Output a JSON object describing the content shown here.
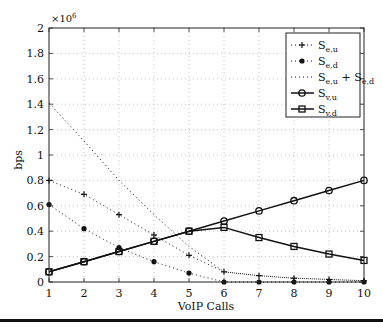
{
  "chart_data": {
    "type": "line",
    "title": "",
    "xlabel": "VoIP Calls",
    "ylabel": "bps",
    "y_multiplier": "×10^6",
    "xlim": [
      1,
      10
    ],
    "ylim": [
      0,
      2
    ],
    "grid": true,
    "legend_position": "upper right",
    "x": [
      1,
      2,
      3,
      4,
      5,
      6,
      7,
      8,
      9,
      10
    ],
    "x_ticks": [
      "1",
      "2",
      "3",
      "4",
      "5",
      "6",
      "7",
      "8",
      "9",
      "10"
    ],
    "y_ticks": [
      "0",
      "0.2",
      "0.4",
      "0.6",
      "0.8",
      "1",
      "1.2",
      "1.4",
      "1.6",
      "1.8",
      "2"
    ],
    "series": [
      {
        "name": "S_e,u",
        "label_main": "S",
        "label_sub": "e,u",
        "style": "dotted",
        "marker": "plus",
        "values": [
          0.8,
          0.69,
          0.53,
          0.37,
          0.21,
          0.08,
          0.05,
          0.03,
          0.02,
          0.01
        ]
      },
      {
        "name": "S_e,d",
        "label_main": "S",
        "label_sub": "e,d",
        "style": "dotted",
        "marker": "dot",
        "values": [
          0.61,
          0.42,
          0.27,
          0.16,
          0.07,
          0.0,
          0.0,
          0.0,
          0.0,
          0.0
        ]
      },
      {
        "name": "S_e,u + S_e,d",
        "label_main": "S",
        "label_sub": "e,u",
        "label_plus": " + S",
        "label_sub2": "e,d",
        "style": "dotted",
        "marker": "none",
        "values": [
          1.41,
          1.11,
          0.8,
          0.53,
          0.28,
          0.08,
          0.05,
          0.03,
          0.02,
          0.01
        ]
      },
      {
        "name": "S_v,u",
        "label_main": "S",
        "label_sub": "v,u",
        "style": "solid",
        "marker": "circle",
        "values": [
          0.08,
          0.16,
          0.24,
          0.32,
          0.4,
          0.48,
          0.56,
          0.64,
          0.72,
          0.8
        ]
      },
      {
        "name": "S_v,d",
        "label_main": "S",
        "label_sub": "v,d",
        "style": "solid",
        "marker": "square",
        "values": [
          0.08,
          0.16,
          0.24,
          0.32,
          0.4,
          0.43,
          0.35,
          0.28,
          0.22,
          0.17
        ]
      }
    ]
  }
}
